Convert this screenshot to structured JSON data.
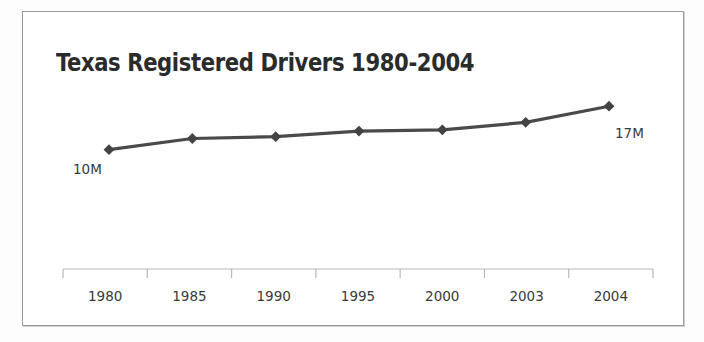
{
  "chart_data": {
    "type": "line",
    "title": "Texas Registered Drivers 1980-2004",
    "xlabel": "",
    "ylabel": "",
    "categories": [
      "1980",
      "1985",
      "1990",
      "1995",
      "2000",
      "2003",
      "2004"
    ],
    "values": [
      10,
      11.8,
      12.1,
      13.0,
      13.2,
      14.4,
      17
    ],
    "value_unit": "M",
    "ylim": [
      8.5,
      18
    ],
    "grid": false,
    "legend": false,
    "legend_position": "none",
    "series": [
      {
        "name": "Texas Registered Drivers",
        "values": [
          10,
          11.8,
          12.1,
          13.0,
          13.2,
          14.4,
          17
        ],
        "color": "#4a4a4a",
        "marker": "diamond"
      }
    ],
    "annotations": [
      {
        "text": "10M",
        "category": "1980",
        "value": 10,
        "position": "below-left"
      },
      {
        "text": "17M",
        "category": "2004",
        "value": 17,
        "position": "below-right"
      }
    ],
    "axis": {
      "x_axis_line": true,
      "y_axis_line": false,
      "tick_direction": "down",
      "axis_color": "#b8b8b8"
    }
  },
  "colors": {
    "line": "#4a4a4a",
    "marker": "#434343",
    "title": "#2b2b2b",
    "axis": "#b8b8b8",
    "label": "#3a3a3a",
    "border": "#9a9a9a",
    "card_background": "#ffffff",
    "page_background": "#fdfdfd"
  }
}
